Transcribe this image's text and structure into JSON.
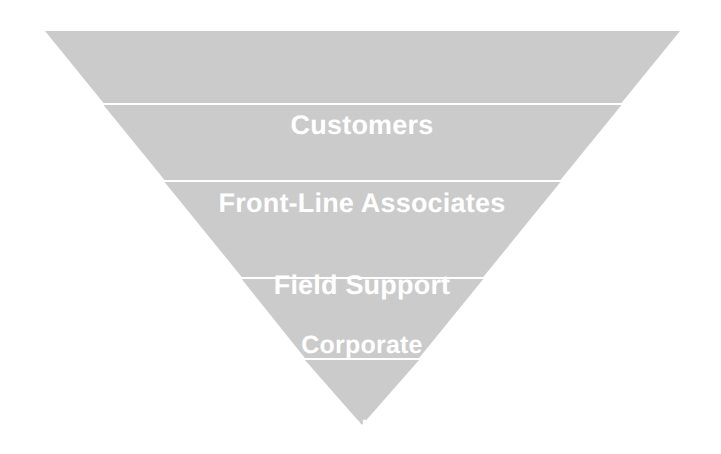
{
  "diagram": {
    "type": "inverted-pyramid",
    "orientation": "inverted",
    "background_color": "#ffffff",
    "fill_color": "#cbcbcb",
    "divider_color": "#ffffff",
    "text_color": "#ffffff",
    "apex": {
      "x": 362,
      "y": 425
    },
    "top_left": {
      "x": 45,
      "y": 31
    },
    "top_right": {
      "x": 680,
      "y": 31
    },
    "levels": [
      {
        "index": 1,
        "label": "Customers",
        "lines": [
          "Customers"
        ],
        "band_top_y": 31,
        "band_bottom_y": 103,
        "width_at_top": 635
      },
      {
        "index": 2,
        "label": "Front-Line Associates",
        "lines": [
          "Front-Line Associates"
        ],
        "band_top_y": 103,
        "band_bottom_y": 178,
        "width_at_top": 519
      },
      {
        "index": 3,
        "label": "Field Support",
        "lines": [
          "Field Support"
        ],
        "band_top_y": 178,
        "band_bottom_y": 273,
        "width_at_top": 398
      },
      {
        "index": 4,
        "label": "Corporate Support",
        "lines": [
          "Corporate",
          "Support"
        ],
        "band_top_y": 273,
        "band_bottom_y": 352,
        "width_at_top": 245
      },
      {
        "index": 5,
        "label": "CEO",
        "lines": [
          "CEO"
        ],
        "band_top_y": 352,
        "band_bottom_y": 425,
        "width_at_top": 118
      }
    ]
  }
}
